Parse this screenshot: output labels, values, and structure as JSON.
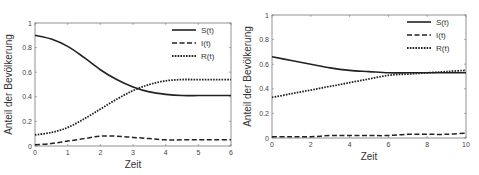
{
  "chart_data": [
    {
      "type": "line",
      "title": "",
      "xlabel": "Zeit",
      "ylabel": "Anteil der Bevölkerung",
      "xlim": [
        0,
        6
      ],
      "ylim": [
        0,
        1
      ],
      "xticks": [
        "0",
        "1",
        "2",
        "3",
        "4",
        "5",
        "6"
      ],
      "yticks": [
        "0",
        "0.2",
        "0.4",
        "0.6",
        "0.8",
        "1"
      ],
      "grid": false,
      "legend_position": "upper right",
      "x": [
        0,
        0.5,
        1,
        1.5,
        2,
        2.5,
        3,
        3.5,
        4,
        4.5,
        5,
        5.5,
        6
      ],
      "series": [
        {
          "name": "S(t)",
          "style": "solid",
          "values": [
            0.9,
            0.87,
            0.81,
            0.72,
            0.62,
            0.54,
            0.48,
            0.44,
            0.42,
            0.41,
            0.41,
            0.41,
            0.41
          ]
        },
        {
          "name": "I(t)",
          "style": "dashed",
          "values": [
            0.01,
            0.02,
            0.04,
            0.06,
            0.08,
            0.08,
            0.07,
            0.06,
            0.05,
            0.05,
            0.05,
            0.05,
            0.05
          ]
        },
        {
          "name": "R(t)",
          "style": "dotted",
          "values": [
            0.09,
            0.11,
            0.15,
            0.22,
            0.3,
            0.38,
            0.45,
            0.5,
            0.53,
            0.54,
            0.54,
            0.54,
            0.54
          ]
        }
      ]
    },
    {
      "type": "line",
      "title": "",
      "xlabel": "Zeit",
      "ylabel": "Anteil der Bevölkerung",
      "xlim": [
        0,
        10
      ],
      "ylim": [
        0,
        1
      ],
      "xticks": [
        "0",
        "2",
        "4",
        "6",
        "8",
        "10"
      ],
      "yticks": [
        "0",
        "0.2",
        "0.4",
        "0.6",
        "0.8",
        "1"
      ],
      "grid": false,
      "legend_position": "upper right",
      "x": [
        0,
        1,
        2,
        3,
        4,
        5,
        6,
        7,
        8,
        9,
        10
      ],
      "series": [
        {
          "name": "S(t)",
          "style": "solid",
          "values": [
            0.66,
            0.63,
            0.6,
            0.57,
            0.55,
            0.54,
            0.53,
            0.53,
            0.53,
            0.53,
            0.53
          ]
        },
        {
          "name": "I(t)",
          "style": "dashed",
          "values": [
            0.01,
            0.01,
            0.01,
            0.02,
            0.02,
            0.02,
            0.02,
            0.03,
            0.03,
            0.03,
            0.04
          ]
        },
        {
          "name": "R(t)",
          "style": "dotted",
          "values": [
            0.33,
            0.36,
            0.39,
            0.42,
            0.45,
            0.48,
            0.51,
            0.52,
            0.53,
            0.54,
            0.55
          ]
        }
      ]
    }
  ],
  "legend_labels": [
    "S(t)",
    "I(t)",
    "R(t)"
  ]
}
